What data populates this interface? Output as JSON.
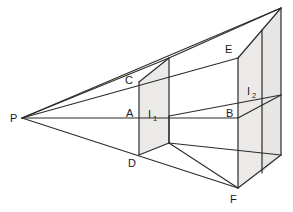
{
  "figure": {
    "background_color": "#ffffff",
    "line_color": "#2b2b2b",
    "shade_color": "#eceae8",
    "label_color": "#1a1a1a",
    "width": 293,
    "height": 212
  },
  "labels": {
    "viewpoint": "P",
    "a": "A",
    "b": "B",
    "c": "C",
    "d": "D",
    "e": "E",
    "f": "F",
    "plane1": "I",
    "plane1_sub": "1",
    "plane2": "I",
    "plane2_sub": "2"
  },
  "label_positions": {
    "viewpoint": {
      "x": 10,
      "y": 122
    },
    "a": {
      "x": 126,
      "y": 117
    },
    "b": {
      "x": 226,
      "y": 117
    },
    "c": {
      "x": 125,
      "y": 84
    },
    "d": {
      "x": 128,
      "y": 167
    },
    "e": {
      "x": 225,
      "y": 53
    },
    "f": {
      "x": 230,
      "y": 203
    },
    "plane1": {
      "x": 148,
      "y": 118
    },
    "plane1_sub": {
      "x": 154,
      "y": 121
    },
    "plane2": {
      "x": 247,
      "y": 95
    },
    "plane2_sub": {
      "x": 253,
      "y": 98
    }
  },
  "geometry": {
    "viewpoint": {
      "name": "P",
      "x": 22,
      "y": 118
    },
    "near_plane": {
      "name": "I1",
      "top_left": {
        "x": 139,
        "y": 82
      },
      "top_right": {
        "x": 169,
        "y": 58
      },
      "bottom_right": {
        "x": 169,
        "y": 143
      },
      "bottom_left": {
        "x": 139,
        "y": 155
      }
    },
    "far_plane": {
      "name": "I2",
      "top_left": {
        "x": 238,
        "y": 58
      },
      "top_right": {
        "x": 281,
        "y": 8
      },
      "bottom_right": {
        "x": 281,
        "y": 155
      },
      "bottom_left": {
        "x": 238,
        "y": 188
      }
    },
    "points": {
      "A": {
        "x": 139,
        "y": 118
      },
      "B": {
        "x": 238,
        "y": 118
      },
      "C": {
        "x": 139,
        "y": 82
      },
      "D": {
        "x": 139,
        "y": 155
      },
      "E": {
        "x": 238,
        "y": 58
      },
      "F": {
        "x": 238,
        "y": 188
      }
    },
    "inner_corners": {
      "near_top_back": {
        "x": 169,
        "y": 58
      },
      "near_mid_back": {
        "x": 169,
        "y": 116
      },
      "near_bottom_back": {
        "x": 169,
        "y": 143
      },
      "far_top_back": {
        "x": 281,
        "y": 8
      },
      "far_mid_back": {
        "x": 281,
        "y": 95
      },
      "far_bottom_back": {
        "x": 281,
        "y": 155
      }
    }
  }
}
